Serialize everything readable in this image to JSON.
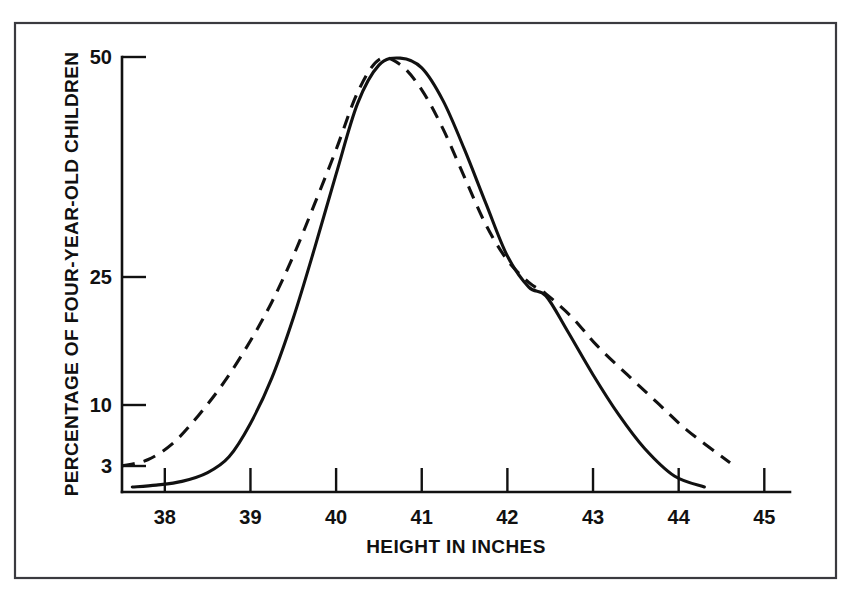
{
  "figure": {
    "background_color": "#ffffff",
    "ink_color": "#111111",
    "frame_color": "#3a3a3f"
  },
  "chart_data": {
    "type": "line",
    "title": "",
    "subtitle": "",
    "xlabel": "HEIGHT IN INCHES",
    "ylabel": "PERCENTAGE OF FOUR-YEAR-OLD CHILDREN",
    "grid": false,
    "legend": null,
    "x_tick_labels": [
      "38",
      "39",
      "40",
      "41",
      "42",
      "43",
      "44",
      "45"
    ],
    "x_tick_values": [
      38,
      39,
      40,
      41,
      42,
      43,
      44,
      45
    ],
    "xlim": [
      37.5,
      45.3
    ],
    "y_tick_labels": [
      "50",
      "25",
      "10",
      "3"
    ],
    "y_tick_values": [
      50,
      25,
      10,
      3
    ],
    "y_scale": "probability",
    "ylim": [
      1.9,
      52
    ],
    "annotations": [],
    "series": [
      {
        "name": "solid-curve",
        "style": "solid",
        "color": "#111111",
        "x": [
          37.62,
          37.9,
          38.2,
          38.5,
          38.75,
          39.0,
          39.25,
          39.5,
          39.75,
          40.0,
          40.25,
          40.5,
          40.75,
          41.0,
          41.25,
          41.5,
          41.75,
          42.0,
          42.25,
          42.45,
          42.7,
          43.0,
          43.3,
          43.6,
          43.95,
          44.3
        ],
        "y": [
          2.4,
          2.45,
          2.55,
          2.8,
          3.3,
          4.6,
          7.0,
          11.5,
          19.0,
          29.5,
          41.5,
          48.5,
          49.8,
          48.0,
          42.0,
          33.5,
          25.0,
          18.0,
          14.5,
          13.6,
          10.4,
          7.2,
          5.0,
          3.6,
          2.7,
          2.4
        ]
      },
      {
        "name": "dashed-curve",
        "style": "dashed",
        "color": "#111111",
        "x": [
          37.5,
          37.8,
          38.1,
          38.4,
          38.7,
          39.0,
          39.25,
          39.5,
          39.75,
          40.0,
          40.25,
          40.5,
          40.75,
          41.0,
          41.25,
          41.5,
          41.75,
          42.0,
          42.25,
          42.45,
          42.75,
          43.05,
          43.4,
          43.75,
          44.1,
          44.6
        ],
        "y": [
          3.0,
          3.2,
          3.8,
          5.0,
          6.8,
          9.6,
          13.0,
          18.0,
          25.0,
          33.5,
          43.5,
          49.5,
          48.6,
          44.0,
          37.0,
          29.0,
          22.0,
          17.5,
          15.0,
          13.8,
          11.6,
          9.2,
          7.2,
          5.6,
          4.3,
          3.1
        ]
      }
    ]
  }
}
